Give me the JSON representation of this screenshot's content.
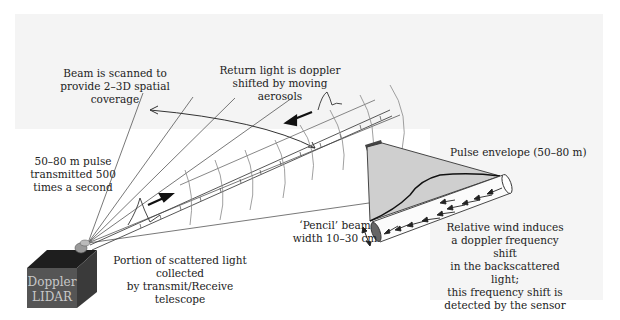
{
  "diagram": {
    "labels": {
      "beam_scanned": "Beam is scanned to\nprovide 2–3D spatial\ncoverage",
      "return_light": "Return light is doppler\nshifted by moving aerosols",
      "pulse_transmit": "50–80 m pulse\ntransmitted 500\ntimes a second",
      "pulse_envelope": "Pulse envelope (50–80 m)",
      "scattered_light": "Portion of scattered light collected\nby transmit/Receive telescope",
      "pencil_beam": "‘Pencil’ beam\nwidth 10–30 cm",
      "relative_wind": "Relative wind induces\na doppler frequency shift\nin the backscattered light;\nthis frequency shift is\ndetected by the sensor",
      "device": "Doppler\nLIDAR"
    },
    "colors": {
      "box_front": "#555555",
      "box_top": "#1e1e1e",
      "box_side": "#3a3a3a",
      "envelope_fill": "#cfcfcf",
      "line": "#333333"
    }
  }
}
